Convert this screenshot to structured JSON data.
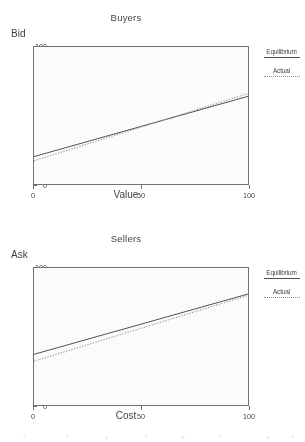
{
  "colors": {
    "equilibrium_line": "#4a4a4a",
    "actual_line": "#8e8e8e",
    "axis": "#6e6e6e",
    "text": "#3a3a3a",
    "background": "#ffffff"
  },
  "legend": {
    "equilibrium_label": "Equilibrium",
    "actual_label": "Actual"
  },
  "chart_data": [
    {
      "id": "buyers",
      "type": "line",
      "title": "Buyers",
      "xlabel": "Value",
      "ylabel": "Bid",
      "xlim": [
        0,
        100
      ],
      "ylim": [
        0,
        100
      ],
      "xticks": [
        0,
        50,
        100
      ],
      "xticklabels": [
        "0",
        "50",
        "100"
      ],
      "yticks": [
        0,
        20,
        40,
        60,
        80,
        100
      ],
      "yticklabels": [
        "0",
        "20",
        "40",
        "60",
        "80",
        "100"
      ],
      "grid": false,
      "legend_position": "right-outside",
      "series": [
        {
          "name": "Equilibrium",
          "style": "solid",
          "color": "#4a4a4a",
          "x": [
            0,
            100
          ],
          "values": [
            20,
            64
          ]
        },
        {
          "name": "Actual",
          "style": "dotted",
          "color": "#8e8e8e",
          "x": [
            0,
            100
          ],
          "values": [
            17,
            66
          ]
        }
      ]
    },
    {
      "id": "sellers",
      "type": "line",
      "title": "Sellers",
      "xlabel": "Cost",
      "ylabel": "Ask",
      "xlim": [
        0,
        100
      ],
      "ylim": [
        0,
        100
      ],
      "xticks": [
        0,
        50,
        100
      ],
      "xticklabels": [
        "0",
        "50",
        "100"
      ],
      "yticks": [
        0,
        20,
        40,
        60,
        80,
        100
      ],
      "yticklabels": [
        "0",
        "20",
        "40",
        "60",
        "80",
        "100"
      ],
      "grid": false,
      "legend_position": "right-outside",
      "series": [
        {
          "name": "Equilibrium",
          "style": "solid",
          "color": "#4a4a4a",
          "x": [
            0,
            100
          ],
          "values": [
            37,
            81
          ]
        },
        {
          "name": "Actual",
          "style": "dotted",
          "color": "#8e8e8e",
          "x": [
            0,
            100
          ],
          "values": [
            32,
            80
          ]
        }
      ]
    }
  ]
}
